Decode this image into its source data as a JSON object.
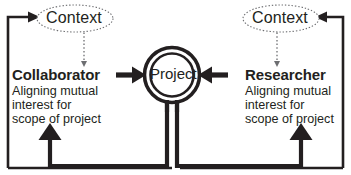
{
  "diagram": {
    "colors": {
      "stroke": "#231f20",
      "text": "#231f20",
      "background": "#ffffff",
      "dotted": "#6d6e71"
    },
    "nodes": {
      "context_left": {
        "label": "Context",
        "shape": "ellipse",
        "border_style": "dotted"
      },
      "context_right": {
        "label": "Context",
        "shape": "ellipse",
        "border_style": "dotted"
      },
      "project": {
        "label": "Project",
        "shape": "double-circle",
        "border_style": "solid"
      },
      "collaborator": {
        "title": "Collaborator",
        "description": "Aligning mutual\ninterest for\nscope of project"
      },
      "researcher": {
        "title": "Researcher",
        "description": "Aligning mutual\ninterest for\nscope of project"
      }
    },
    "edges": [
      {
        "name": "collaborator-to-project",
        "from": "collaborator",
        "to": "project",
        "style": "solid",
        "arrow": "right"
      },
      {
        "name": "researcher-to-project",
        "from": "researcher",
        "to": "project",
        "style": "solid",
        "arrow": "left"
      },
      {
        "name": "context-left-to-collaborator",
        "from": "context_left",
        "to": "collaborator",
        "style": "dotted",
        "arrow": "down"
      },
      {
        "name": "context-right-to-researcher",
        "from": "context_right",
        "to": "researcher",
        "style": "dotted",
        "arrow": "down"
      },
      {
        "name": "project-feedback-to-collaborator",
        "from": "project",
        "to": "collaborator",
        "style": "solid",
        "arrow": "up"
      },
      {
        "name": "project-feedback-to-researcher",
        "from": "project",
        "to": "researcher",
        "style": "solid",
        "arrow": "up"
      },
      {
        "name": "loop-left-to-context",
        "from": "bottom-left",
        "to": "context_left",
        "style": "solid",
        "arrow": "right"
      },
      {
        "name": "loop-right-to-context",
        "from": "bottom-right",
        "to": "context_right",
        "style": "solid",
        "arrow": "left"
      }
    ],
    "caption": ""
  }
}
